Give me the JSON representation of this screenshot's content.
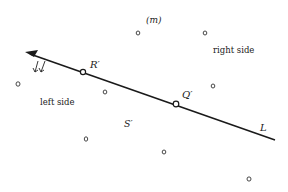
{
  "diagram": {
    "line": {
      "label": "L",
      "start": [
        25,
        52
      ],
      "end": [
        275,
        140
      ],
      "arrow_at": "start",
      "color": "#1a1a1a"
    },
    "points_on_line": [
      {
        "name": "R'",
        "label": "R′",
        "x": 83,
        "y": 72,
        "label_x": 91,
        "label_y": 67
      },
      {
        "name": "Q'",
        "label": "Q′",
        "x": 176,
        "y": 104,
        "label_x": 182,
        "label_y": 98
      }
    ],
    "region_labels": {
      "top": "(m)",
      "right": "right side",
      "left": "left side",
      "region": "S′"
    },
    "direction_marks": "↙↙",
    "scattered_points": [
      {
        "x": 138,
        "y": 33
      },
      {
        "x": 205,
        "y": 33
      },
      {
        "x": 213,
        "y": 86
      },
      {
        "x": 18,
        "y": 84
      },
      {
        "x": 105,
        "y": 92
      },
      {
        "x": 86,
        "y": 139
      },
      {
        "x": 164,
        "y": 152
      },
      {
        "x": 249,
        "y": 179
      }
    ]
  }
}
